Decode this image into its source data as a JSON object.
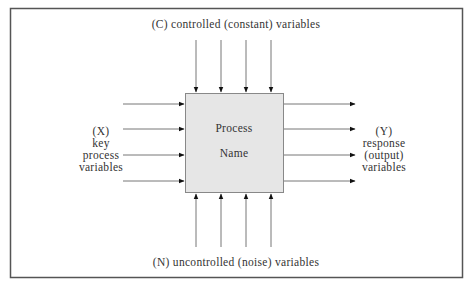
{
  "diagram": {
    "type": "process-model",
    "process": {
      "line1": "Process",
      "line2": "Name"
    },
    "top_label": "(C) controlled (constant) variables",
    "bottom_label": "(N) uncontrolled (noise) variables",
    "left_label": {
      "line1": "(X)",
      "line2": "key",
      "line3": "process",
      "line4": "variables"
    },
    "right_label": {
      "line1": "(Y)",
      "line2": "response",
      "line3": "(output)",
      "line4": "variables"
    },
    "arrows": {
      "top_count": 4,
      "bottom_count": 4,
      "left_count": 4,
      "right_count": 4
    },
    "colors": {
      "frame": "#555555",
      "box_fill": "#e6e6e6",
      "box_stroke": "#888888",
      "arrow_line": "#777777",
      "arrow_head": "#111111",
      "text": "#333333"
    }
  }
}
